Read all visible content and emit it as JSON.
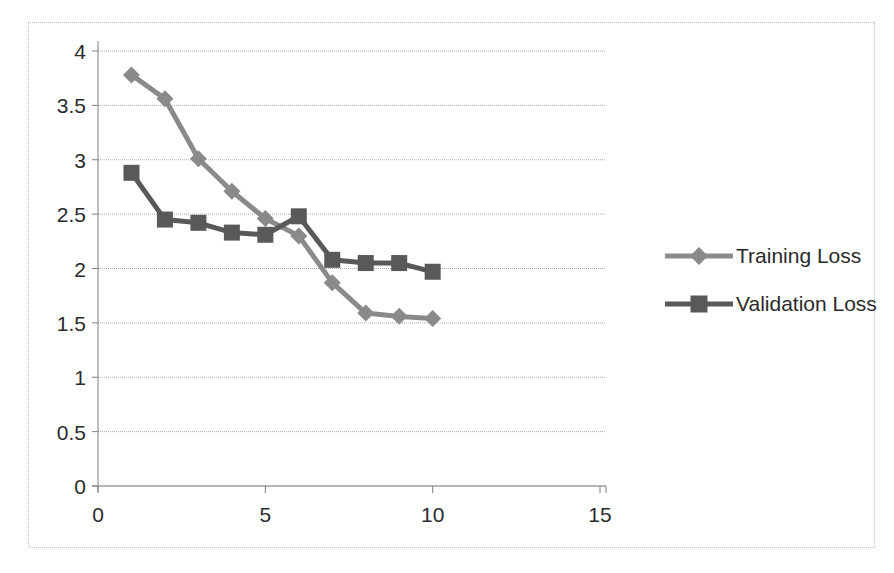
{
  "chart_data": {
    "type": "line",
    "title": "",
    "xlabel": "",
    "ylabel": "",
    "xlim": [
      0,
      15
    ],
    "ylim": [
      0,
      4
    ],
    "xticks": [
      "0",
      "5",
      "10",
      "15"
    ],
    "xtick_values": [
      0,
      5,
      10,
      15
    ],
    "yticks": [
      "0",
      "0.5",
      "1",
      "1.5",
      "2",
      "2.5",
      "3",
      "3.5",
      "4"
    ],
    "ytick_values": [
      0,
      0.5,
      1,
      1.5,
      2,
      2.5,
      3,
      3.5,
      4
    ],
    "grid": "horizontal",
    "legend_position": "right",
    "x": [
      1,
      2,
      3,
      4,
      5,
      6,
      7,
      8,
      9,
      10
    ],
    "series": [
      {
        "name": "Training Loss",
        "marker": "diamond",
        "color": "#8a8a8a",
        "values": [
          3.78,
          3.56,
          3.01,
          2.71,
          2.46,
          2.3,
          1.87,
          1.59,
          1.56,
          1.54
        ]
      },
      {
        "name": "Validation Loss",
        "marker": "square",
        "color": "#595959",
        "values": [
          2.88,
          2.45,
          2.42,
          2.33,
          2.31,
          2.48,
          2.08,
          2.05,
          2.05,
          1.97
        ]
      }
    ]
  },
  "legend": {
    "items": [
      {
        "label": "Training Loss"
      },
      {
        "label": "Validation Loss"
      }
    ]
  },
  "axes": {
    "axis_color": "#808080",
    "grid_color": "#aaaaaa",
    "border_color": "#b9b9b9",
    "plot_background": "#ffffff"
  }
}
